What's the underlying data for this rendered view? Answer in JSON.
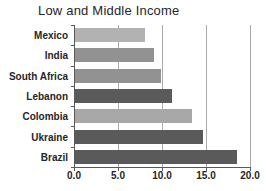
{
  "chart_data": {
    "type": "bar",
    "orientation": "horizontal",
    "title": "Low and Middle Income",
    "categories": [
      "Mexico",
      "India",
      "South Africa",
      "Lebanon",
      "Colombia",
      "Ukraine",
      "Brazil"
    ],
    "values": [
      8.0,
      9.0,
      9.8,
      11.0,
      13.3,
      14.5,
      18.4
    ],
    "bar_colors": [
      "#b2b2b2",
      "#929292",
      "#929292",
      "#5a5a5a",
      "#a8a8a8",
      "#5a5a5a",
      "#5a5a5a"
    ],
    "x_ticks": [
      "0.0",
      "5.0",
      "10.0",
      "15.0",
      "20.0"
    ],
    "x_tick_values": [
      0,
      5,
      10,
      15,
      20
    ],
    "xlim": [
      0,
      20
    ],
    "xlabel": "",
    "ylabel": "",
    "grid": "vertical-gridlines",
    "legend": "none",
    "colors": {
      "gridline": "#ababab",
      "axis": "#595959",
      "text": "#262626",
      "background": "#ffffff"
    }
  }
}
